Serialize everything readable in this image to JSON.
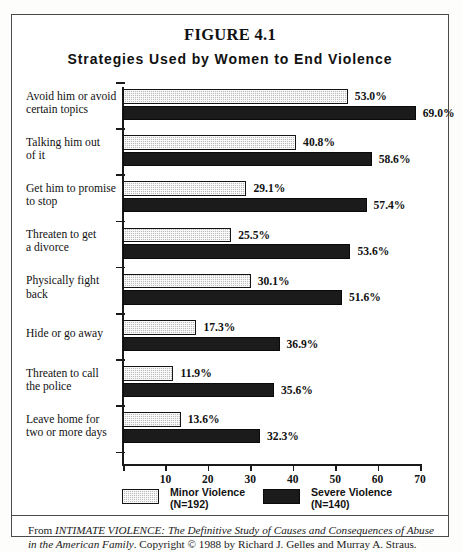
{
  "figure": {
    "title": "FIGURE 4.1",
    "subtitle": "Strategies Used by Women to End Violence"
  },
  "source_note": {
    "prefix": "From ",
    "italic_1": "INTIMATE VIOLENCE: The Definitive Study of Causes and Consequences of Abuse in the American Family",
    "middle": ". Copyright © 1988 by Richard J. Gelles and Murray A. Straus."
  },
  "chart_data": {
    "type": "bar",
    "orientation": "horizontal",
    "title": "Strategies Used by Women to End Violence",
    "xlabel": "",
    "ylabel": "",
    "xlim": [
      0,
      70
    ],
    "xticks": [
      0,
      10,
      20,
      30,
      40,
      50,
      60,
      70
    ],
    "xtick_labels": [
      "",
      "10",
      "20",
      "30",
      "40",
      "50",
      "60",
      "70"
    ],
    "grid": false,
    "legend_position": "bottom",
    "value_suffix": "%",
    "categories": [
      "Avoid him or avoid certain topics",
      "Talking him out of it",
      "Get him to promise to stop",
      "Threaten to get a divorce",
      "Physically fight back",
      "Hide or go away",
      "Threaten to call the police",
      "Leave home for two or more days"
    ],
    "category_lines": [
      [
        "Avoid him or avoid",
        "certain topics"
      ],
      [
        "Talking him out",
        "of it"
      ],
      [
        "Get him to promise",
        "to stop"
      ],
      [
        "Threaten to get",
        "a divorce"
      ],
      [
        "Physically fight",
        "back"
      ],
      [
        "Hide or go away"
      ],
      [
        "Threaten to call",
        "the police"
      ],
      [
        "Leave home for",
        "two or more days"
      ]
    ],
    "series": [
      {
        "name": "Minor Violence",
        "n_label": "(N=192)",
        "color": "#bdbdbd",
        "pattern": "dotted-gray",
        "values": [
          53.0,
          40.8,
          29.1,
          25.5,
          30.1,
          17.3,
          11.9,
          13.6
        ],
        "labels": [
          "53.0%",
          "40.8%",
          "29.1%",
          "25.5%",
          "30.1%",
          "17.3%",
          "11.9%",
          "13.6%"
        ]
      },
      {
        "name": "Severe Violence",
        "n_label": "(N=140)",
        "color": "#1b1b1b",
        "pattern": "solid-black",
        "values": [
          69.0,
          58.6,
          57.4,
          53.6,
          51.6,
          36.9,
          35.6,
          32.3
        ],
        "labels": [
          "69.0%",
          "58.6%",
          "57.4%",
          "53.6%",
          "51.6%",
          "36.9%",
          "35.6%",
          "32.3%"
        ]
      }
    ]
  },
  "legend": [
    {
      "name": "Minor Violence",
      "n_label": "(N=192)",
      "swatch": "minor"
    },
    {
      "name": "Severe Violence",
      "n_label": "(N=140)",
      "swatch": "severe"
    }
  ]
}
